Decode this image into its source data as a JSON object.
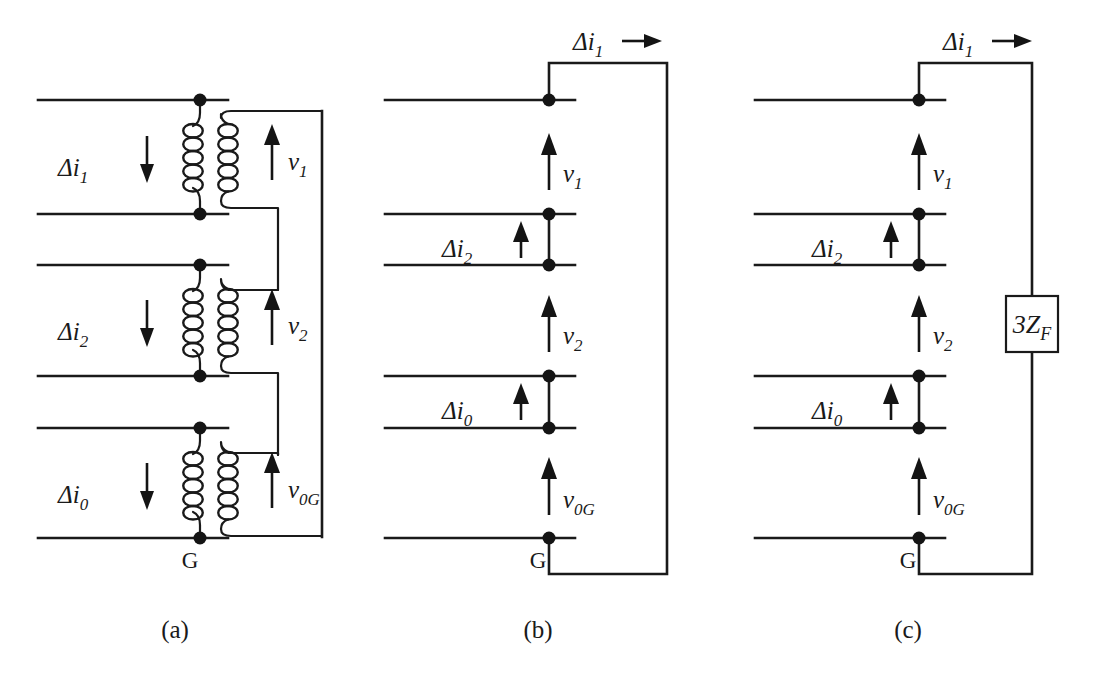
{
  "figure": {
    "background_color": "#ffffff",
    "line_color": "#1a1a1a",
    "node_color": "#141414"
  },
  "panels": [
    {
      "id": "a",
      "caption": "(a)",
      "kind": "transformer-coupled-network",
      "current_labels": [
        {
          "name": "delta-i1",
          "base": "Δi",
          "sub": "1",
          "direction": "down"
        },
        {
          "name": "delta-i2",
          "base": "Δi",
          "sub": "2",
          "direction": "down"
        },
        {
          "name": "delta-i0",
          "base": "Δi",
          "sub": "0",
          "direction": "down"
        }
      ],
      "voltage_labels": [
        {
          "name": "v1",
          "base": "v",
          "sub": "1",
          "direction": "up"
        },
        {
          "name": "v2",
          "base": "v",
          "sub": "2",
          "direction": "up"
        },
        {
          "name": "v0G",
          "base": "v",
          "sub": "0G",
          "direction": "up"
        }
      ],
      "ground_label": "G",
      "coils": 3,
      "coil_turns": 4
    },
    {
      "id": "b",
      "caption": "(b)",
      "kind": "series-connected-network-shorted",
      "top_current_label": {
        "name": "delta-i1-top",
        "base": "Δi",
        "sub": "1",
        "direction": "right"
      },
      "current_labels": [
        {
          "name": "delta-i2",
          "base": "Δi",
          "sub": "2",
          "direction": "up"
        },
        {
          "name": "delta-i0",
          "base": "Δi",
          "sub": "0",
          "direction": "up"
        }
      ],
      "voltage_labels": [
        {
          "name": "v1",
          "base": "v",
          "sub": "1",
          "direction": "up"
        },
        {
          "name": "v2",
          "base": "v",
          "sub": "2",
          "direction": "up"
        },
        {
          "name": "v0G",
          "base": "v",
          "sub": "0G",
          "direction": "up"
        }
      ],
      "ground_label": "G"
    },
    {
      "id": "c",
      "caption": "(c)",
      "kind": "series-connected-network-with-fault-impedance",
      "top_current_label": {
        "name": "delta-i1-top",
        "base": "Δi",
        "sub": "1",
        "direction": "right"
      },
      "current_labels": [
        {
          "name": "delta-i2",
          "base": "Δi",
          "sub": "2",
          "direction": "up"
        },
        {
          "name": "delta-i0",
          "base": "Δi",
          "sub": "0",
          "direction": "up"
        }
      ],
      "voltage_labels": [
        {
          "name": "v1",
          "base": "v",
          "sub": "1",
          "direction": "up"
        },
        {
          "name": "v2",
          "base": "v",
          "sub": "2",
          "direction": "up"
        },
        {
          "name": "v0G",
          "base": "v",
          "sub": "0G",
          "direction": "up"
        }
      ],
      "ground_label": "G",
      "impedance_box": {
        "name": "fault-impedance",
        "base": "3Z",
        "sub": "F"
      }
    }
  ],
  "captions": {
    "a": "(a)",
    "b": "(b)",
    "c": "(c)"
  },
  "ground": {
    "label": "G"
  },
  "impedance": {
    "base": "3Z",
    "sub": "F"
  },
  "labels": {
    "delta_i1": {
      "base": "Δi",
      "sub": "1"
    },
    "delta_i2": {
      "base": "Δi",
      "sub": "2"
    },
    "delta_i0": {
      "base": "Δi",
      "sub": "0"
    },
    "v1": {
      "base": "v",
      "sub": "1"
    },
    "v2": {
      "base": "v",
      "sub": "2"
    },
    "v0G": {
      "base": "v",
      "sub": "0G"
    }
  }
}
